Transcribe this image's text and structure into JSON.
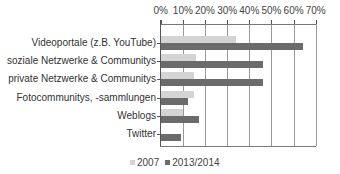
{
  "chart_data": {
    "type": "bar",
    "orientation": "horizontal",
    "title": "",
    "xlabel": "",
    "ylabel": "",
    "xlim": [
      0,
      70
    ],
    "x_ticks": [
      "0%",
      "10%",
      "20%",
      "30%",
      "40%",
      "50%",
      "60%",
      "70%"
    ],
    "x_axis_position": "top",
    "grid": true,
    "legend_position": "bottom",
    "categories": [
      "Videoportale (z.B. YouTube)",
      "soziale Netzwerke & Communitys",
      "private Netzwerke  & Communitys",
      "Fotocommunitys, -sammlungen",
      "Weblogs",
      "Twitter"
    ],
    "series": [
      {
        "name": "2007",
        "color": "#d4d4d4",
        "values": [
          34,
          16,
          15,
          15,
          10,
          0
        ]
      },
      {
        "name": "2013/2014",
        "color": "#6b6b6b",
        "values": [
          64,
          46,
          46,
          12,
          17,
          9
        ]
      }
    ]
  }
}
